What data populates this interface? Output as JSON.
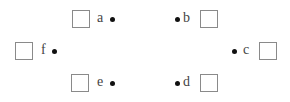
{
  "diagram": {
    "items": [
      {
        "id": "a",
        "label": "a",
        "side": "box-left"
      },
      {
        "id": "b",
        "label": "b",
        "side": "box-right"
      },
      {
        "id": "c",
        "label": "c",
        "side": "box-right"
      },
      {
        "id": "d",
        "label": "d",
        "side": "box-right"
      },
      {
        "id": "e",
        "label": "e",
        "side": "box-left"
      },
      {
        "id": "f",
        "label": "f",
        "side": "box-left"
      }
    ]
  }
}
